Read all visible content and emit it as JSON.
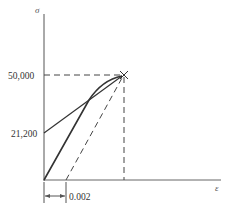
{
  "diagram": {
    "type": "stress-strain offset diagram",
    "axes": {
      "y_label": "σ",
      "x_label": "ε"
    },
    "labels": {
      "stress_peak": "50,000",
      "stress_intercept": "21,200",
      "offset_strain": "0.002"
    },
    "colors": {
      "line": "#333333",
      "axis": "#555555",
      "background": "#ffffff"
    }
  }
}
